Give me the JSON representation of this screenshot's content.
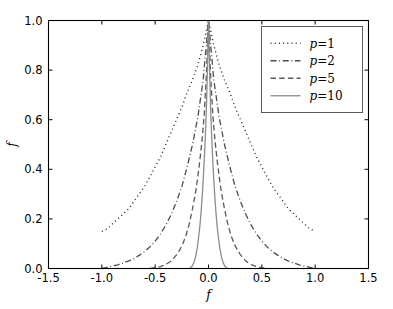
{
  "chart_data": {
    "type": "line",
    "title": "",
    "xlabel": "f",
    "ylabel": "f",
    "xlim": [
      -1.5,
      1.5
    ],
    "ylim": [
      0.0,
      1.0
    ],
    "grid": false,
    "legend_position": "upper right",
    "xticks": [
      "-1.5",
      "-1.0",
      "-0.5",
      "0.0",
      "0.5",
      "1.0",
      "1.5"
    ],
    "xtick_values": [
      -1.5,
      -1.0,
      -0.5,
      0.0,
      0.5,
      1.0,
      1.5
    ],
    "yticks": [
      "0.0",
      "0.2",
      "0.4",
      "0.6",
      "0.8",
      "1.0"
    ],
    "ytick_values": [
      0.0,
      0.2,
      0.4,
      0.6,
      0.8,
      1.0
    ],
    "series": [
      {
        "name": "p=1",
        "legend_label_prefix": "p",
        "legend_label_value": "1",
        "linestyle": "dotted",
        "color": "#262626",
        "linewidth": 1.4,
        "x": [
          -1.0,
          -0.95,
          -0.9,
          -0.85,
          -0.8,
          -0.75,
          -0.7,
          -0.65,
          -0.6,
          -0.55,
          -0.5,
          -0.45,
          -0.4,
          -0.35,
          -0.3,
          -0.25,
          -0.2,
          -0.15,
          -0.1,
          -0.05,
          0.0,
          0.05,
          0.1,
          0.15,
          0.2,
          0.25,
          0.3,
          0.35,
          0.4,
          0.45,
          0.5,
          0.55,
          0.6,
          0.65,
          0.7,
          0.75,
          0.8,
          0.85,
          0.9,
          0.95,
          1.0
        ],
        "y": [
          0.15,
          0.16,
          0.18,
          0.2,
          0.22,
          0.24,
          0.27,
          0.3,
          0.33,
          0.37,
          0.41,
          0.45,
          0.5,
          0.55,
          0.6,
          0.65,
          0.71,
          0.76,
          0.82,
          0.9,
          1.0,
          0.9,
          0.82,
          0.76,
          0.71,
          0.65,
          0.6,
          0.55,
          0.5,
          0.45,
          0.41,
          0.37,
          0.33,
          0.3,
          0.27,
          0.24,
          0.22,
          0.2,
          0.18,
          0.16,
          0.15
        ]
      },
      {
        "name": "p=2",
        "legend_label_prefix": "p",
        "legend_label_value": "2",
        "linestyle": "dashdot",
        "color": "#4d4d4d",
        "linewidth": 1.3,
        "x": [
          -1.0,
          -0.95,
          -0.9,
          -0.85,
          -0.8,
          -0.75,
          -0.7,
          -0.65,
          -0.6,
          -0.55,
          -0.5,
          -0.45,
          -0.4,
          -0.35,
          -0.3,
          -0.25,
          -0.2,
          -0.15,
          -0.1,
          -0.05,
          0.0,
          0.05,
          0.1,
          0.15,
          0.2,
          0.25,
          0.3,
          0.35,
          0.4,
          0.45,
          0.5,
          0.55,
          0.6,
          0.65,
          0.7,
          0.75,
          0.8,
          0.85,
          0.9,
          0.95,
          1.0
        ],
        "y": [
          0.0,
          0.005,
          0.01,
          0.015,
          0.022,
          0.03,
          0.04,
          0.053,
          0.068,
          0.087,
          0.11,
          0.14,
          0.175,
          0.218,
          0.27,
          0.33,
          0.41,
          0.5,
          0.61,
          0.76,
          1.0,
          0.76,
          0.61,
          0.5,
          0.41,
          0.33,
          0.27,
          0.218,
          0.175,
          0.14,
          0.11,
          0.087,
          0.068,
          0.053,
          0.04,
          0.03,
          0.022,
          0.015,
          0.01,
          0.005,
          0.0
        ]
      },
      {
        "name": "p=5",
        "legend_label_prefix": "p",
        "legend_label_value": "5",
        "linestyle": "dashed",
        "color": "#595959",
        "linewidth": 1.3,
        "x": [
          -0.55,
          -0.5,
          -0.45,
          -0.4,
          -0.35,
          -0.3,
          -0.27,
          -0.24,
          -0.21,
          -0.18,
          -0.15,
          -0.12,
          -0.1,
          -0.08,
          -0.06,
          -0.04,
          -0.02,
          0.0,
          0.02,
          0.04,
          0.06,
          0.08,
          0.1,
          0.12,
          0.15,
          0.18,
          0.21,
          0.24,
          0.27,
          0.3,
          0.35,
          0.4,
          0.45,
          0.5,
          0.55
        ],
        "y": [
          0.0,
          0.003,
          0.008,
          0.016,
          0.03,
          0.055,
          0.075,
          0.1,
          0.135,
          0.18,
          0.24,
          0.31,
          0.37,
          0.44,
          0.52,
          0.62,
          0.78,
          1.0,
          0.78,
          0.62,
          0.52,
          0.44,
          0.37,
          0.31,
          0.24,
          0.18,
          0.135,
          0.1,
          0.075,
          0.055,
          0.03,
          0.016,
          0.008,
          0.003,
          0.0
        ]
      },
      {
        "name": "p=10",
        "legend_label_prefix": "p",
        "legend_label_value": "10",
        "linestyle": "solid",
        "color": "#8c8c8c",
        "linewidth": 1.3,
        "x": [
          -0.18,
          -0.165,
          -0.15,
          -0.135,
          -0.12,
          -0.105,
          -0.09,
          -0.08,
          -0.07,
          -0.06,
          -0.05,
          -0.04,
          -0.03,
          -0.02,
          -0.01,
          0.0,
          0.01,
          0.02,
          0.03,
          0.04,
          0.05,
          0.06,
          0.07,
          0.08,
          0.09,
          0.105,
          0.12,
          0.135,
          0.15,
          0.165,
          0.18
        ],
        "y": [
          0.0,
          0.004,
          0.012,
          0.026,
          0.05,
          0.085,
          0.135,
          0.175,
          0.225,
          0.285,
          0.355,
          0.435,
          0.53,
          0.645,
          0.8,
          1.0,
          0.8,
          0.645,
          0.53,
          0.435,
          0.355,
          0.285,
          0.225,
          0.175,
          0.135,
          0.085,
          0.05,
          0.026,
          0.012,
          0.004,
          0.0
        ]
      }
    ]
  },
  "axes": {
    "spine_color": "#000000",
    "background": "#ffffff"
  },
  "legend": {
    "border_color": "#5a5a5a",
    "background": "#ffffff"
  }
}
